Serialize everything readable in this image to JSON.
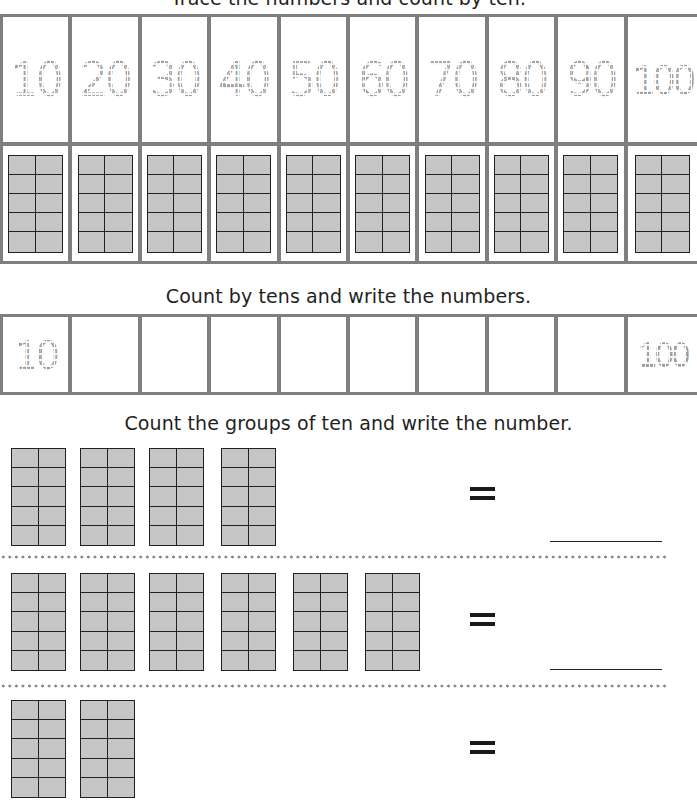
{
  "worksheet": {
    "sections": {
      "trace": {
        "instruction": "Trace the numbers and count by ten.",
        "numbers": [
          "10",
          "20",
          "30",
          "40",
          "50",
          "60",
          "70",
          "80",
          "90",
          "100"
        ],
        "frames_per_column": 1
      },
      "write": {
        "instruction": "Count by tens and write the numbers.",
        "cells": [
          "10",
          "",
          "",
          "",
          "",
          "",
          "",
          "",
          "",
          "100"
        ]
      },
      "count_groups": {
        "instruction": "Count the groups of ten and write the number.",
        "equals_symbol": "=",
        "problems": [
          {
            "groups_of_ten": 4,
            "answer": ""
          },
          {
            "groups_of_ten": 6,
            "answer": ""
          },
          {
            "groups_of_ten": 2,
            "answer": ""
          }
        ]
      }
    },
    "colors": {
      "grid_border": "#7f7f7f",
      "frame_fill": "#c6c6c6",
      "frame_line": "#222222",
      "trace_dash": "#9a9a9a",
      "divider_dots": "#8a8a8a"
    }
  }
}
